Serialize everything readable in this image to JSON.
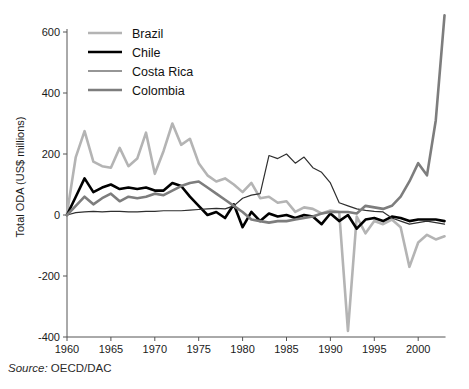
{
  "figure": {
    "source_label": "Source:",
    "source_value": "OECD/DAC"
  },
  "chart_data": {
    "type": "line",
    "title": "",
    "subtitle": "",
    "xlabel": "",
    "ylabel": "Total ODA (US$ millions)",
    "xlim": [
      1960,
      2003
    ],
    "ylim": [
      -400,
      650
    ],
    "grid": false,
    "legend_position": "top-left-inside",
    "xticks": [
      1960,
      1965,
      1970,
      1975,
      1980,
      1985,
      1990,
      1995,
      2000
    ],
    "xtick_labels": [
      "1960",
      "1965",
      "1970",
      "1975",
      "1980",
      "1985",
      "1990",
      "1995",
      "2000"
    ],
    "yticks": [
      -400,
      -200,
      0,
      200,
      400,
      600
    ],
    "ytick_labels": [
      "-400",
      "-200",
      "0",
      "200",
      "400",
      "600"
    ],
    "x": [
      1960,
      1961,
      1962,
      1963,
      1964,
      1965,
      1966,
      1967,
      1968,
      1969,
      1970,
      1971,
      1972,
      1973,
      1974,
      1975,
      1976,
      1977,
      1978,
      1979,
      1980,
      1981,
      1982,
      1983,
      1984,
      1985,
      1986,
      1987,
      1988,
      1989,
      1990,
      1991,
      1992,
      1993,
      1994,
      1995,
      1996,
      1997,
      1998,
      1999,
      2000,
      2001,
      2002,
      2003
    ],
    "series": [
      {
        "name": "Brazil",
        "color": "#b4b4b4",
        "width": 2.6,
        "values": [
          5,
          190,
          275,
          175,
          160,
          155,
          220,
          160,
          185,
          270,
          135,
          210,
          300,
          230,
          250,
          170,
          130,
          110,
          120,
          100,
          75,
          105,
          55,
          60,
          40,
          45,
          10,
          25,
          20,
          5,
          15,
          10,
          -380,
          -5,
          -60,
          -20,
          -30,
          -15,
          -40,
          -170,
          -90,
          -65,
          -80,
          -70
        ]
      },
      {
        "name": "Chile",
        "color": "#000000",
        "width": 2.6,
        "values": [
          0,
          60,
          120,
          75,
          90,
          100,
          85,
          90,
          85,
          90,
          80,
          80,
          105,
          95,
          60,
          30,
          0,
          10,
          -10,
          35,
          -40,
          10,
          -20,
          5,
          -5,
          0,
          -10,
          0,
          -5,
          -30,
          5,
          -20,
          0,
          -45,
          -15,
          -10,
          -20,
          -5,
          -10,
          -20,
          -15,
          -15,
          -15,
          -20
        ]
      },
      {
        "name": "Costa Rica",
        "color": "#2f2f2f",
        "width": 1.2,
        "values": [
          0,
          8,
          10,
          12,
          10,
          12,
          12,
          10,
          10,
          12,
          12,
          14,
          14,
          14,
          16,
          18,
          20,
          22,
          20,
          30,
          55,
          65,
          70,
          195,
          185,
          200,
          170,
          190,
          155,
          140,
          105,
          40,
          30,
          20,
          15,
          12,
          10,
          -10,
          -20,
          -30,
          -25,
          -20,
          -25,
          -30
        ]
      },
      {
        "name": "Colombia",
        "color": "#7d7d7d",
        "width": 2.6,
        "values": [
          0,
          30,
          60,
          35,
          55,
          70,
          45,
          60,
          55,
          60,
          70,
          65,
          80,
          95,
          105,
          110,
          90,
          70,
          50,
          30,
          10,
          -15,
          -20,
          -25,
          -20,
          -20,
          -15,
          -10,
          -5,
          5,
          10,
          10,
          10,
          5,
          30,
          25,
          20,
          30,
          60,
          110,
          170,
          130,
          310,
          655
        ]
      }
    ]
  },
  "legend": {
    "items": [
      {
        "label": "Brazil"
      },
      {
        "label": "Chile"
      },
      {
        "label": "Costa Rica"
      },
      {
        "label": "Colombia"
      }
    ]
  }
}
